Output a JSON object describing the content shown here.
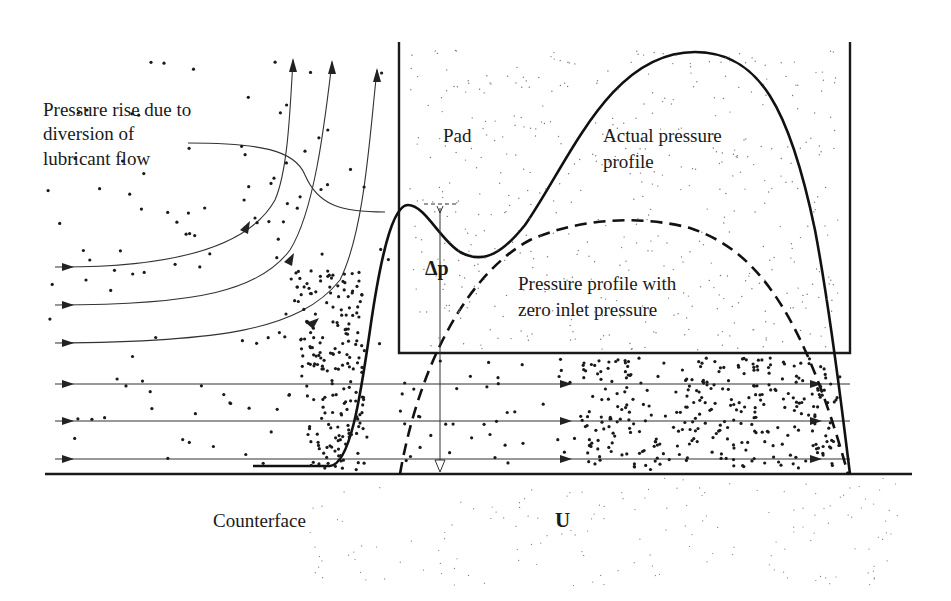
{
  "diagram": {
    "labels": {
      "annotation_line1": "Pressure rise due to",
      "annotation_line2": "diversion of",
      "annotation_line3": "lubricant flow",
      "pad": "Pad",
      "actual_line1": "Actual pressure",
      "actual_line2": "profile",
      "delta_p": "Δp",
      "zero_line1": "Pressure profile with",
      "zero_line2": "zero inlet pressure",
      "counterface": "Counterface",
      "velocity": "U"
    },
    "elements": {
      "pad": "rectangular bearing pad",
      "counterface": "moving surface (velocity U)",
      "actual_profile": "solid curve with inlet bump",
      "zero_inlet_profile": "dashed parabolic curve",
      "flow_lines": "streamlines diverted upward at pad inlet plus straight streamlines under pad"
    },
    "colors": {
      "ink": "#1a1a1a",
      "background": "#ffffff",
      "speckle": "#555555"
    }
  }
}
